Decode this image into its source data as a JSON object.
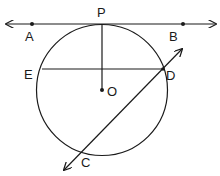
{
  "diagram": {
    "type": "geometry",
    "labels": {
      "P": "P",
      "A": "A",
      "B": "B",
      "E": "E",
      "D": "D",
      "O": "O",
      "C": "C"
    },
    "colors": {
      "stroke": "#1a1a1a",
      "background": "#ffffff"
    },
    "elements": {
      "circle": {
        "center": "O",
        "passes_through": [
          "P",
          "E",
          "D",
          "C"
        ]
      },
      "tangent_line": {
        "points": [
          "A",
          "P",
          "B"
        ],
        "arrows": "both"
      },
      "radius": {
        "from": "O",
        "to": "P"
      },
      "chord": {
        "from": "E",
        "to": "D"
      },
      "secant_line": {
        "points": [
          "D",
          "C"
        ],
        "arrows": "both"
      }
    }
  }
}
